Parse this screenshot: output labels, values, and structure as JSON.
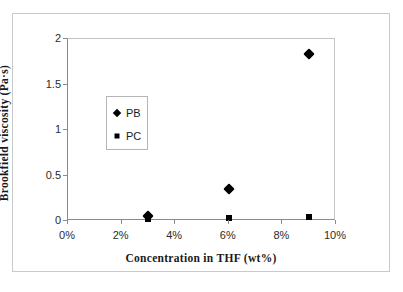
{
  "chart_data": {
    "type": "scatter",
    "title": "",
    "xlabel": "Concentration in THF (wt%)",
    "ylabel": "Brookfield viscosity (Pa·s)",
    "xlim": [
      0,
      10
    ],
    "ylim": [
      0,
      2
    ],
    "xticks": [
      "0%",
      "2%",
      "4%",
      "6%",
      "8%",
      "10%"
    ],
    "xtick_values": [
      0,
      2,
      4,
      6,
      8,
      10
    ],
    "yticks": [
      "0",
      "0.5",
      "1",
      "1.5",
      "2"
    ],
    "ytick_values": [
      0,
      0.5,
      1,
      1.5,
      2
    ],
    "grid": false,
    "legend_position": "inside-left",
    "series": [
      {
        "name": "PB",
        "marker": "diamond",
        "color": "#000000",
        "x": [
          3,
          6,
          9
        ],
        "values": [
          0.05,
          0.35,
          1.83
        ]
      },
      {
        "name": "PC",
        "marker": "square",
        "color": "#000000",
        "x": [
          3,
          6,
          9
        ],
        "values": [
          0.02,
          0.03,
          0.04
        ]
      }
    ]
  }
}
